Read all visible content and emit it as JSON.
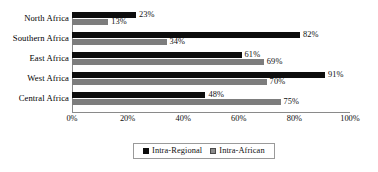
{
  "chart_data": {
    "type": "bar",
    "orientation": "horizontal",
    "title": "",
    "xlabel": "",
    "ylabel": "",
    "categories": [
      "North Africa",
      "Southern Africa",
      "East Africa",
      "West Africa",
      "Central Africa"
    ],
    "series": [
      {
        "name": "Intra-Regional",
        "color": "#0d0d0d",
        "values": [
          23,
          82,
          61,
          91,
          48
        ],
        "labels": [
          "23%",
          "82%",
          "61%",
          "91%",
          "48%"
        ]
      },
      {
        "name": "Intra-African",
        "color": "#7d7d7d",
        "values": [
          13,
          34,
          69,
          70,
          75
        ],
        "labels": [
          "13%",
          "34%",
          "69%",
          "70%",
          "75%"
        ]
      }
    ],
    "xlim": [
      0,
      100
    ],
    "xticks": [
      0,
      20,
      40,
      60,
      80,
      100
    ],
    "xtick_labels": [
      "0%",
      "20%",
      "40%",
      "60%",
      "80%",
      "100%"
    ],
    "grid": false,
    "legend_position": "bottom",
    "value_labels": true
  },
  "legend": {
    "items": [
      {
        "label": "Intra-Regional"
      },
      {
        "label": "Intra-African"
      }
    ]
  },
  "top_bleed": {
    "text": ""
  }
}
